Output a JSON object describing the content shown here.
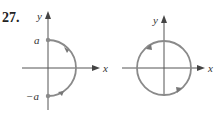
{
  "problem_number": "27.",
  "figures": [
    {
      "name": "semicircle",
      "axis_labels": {
        "x": "x",
        "y": "y"
      },
      "point_labels": {
        "top": "a",
        "bottom": "−a"
      },
      "direction": "counterclockwise (from -a up to a)"
    },
    {
      "name": "full-circle",
      "axis_labels": {
        "x": "x",
        "y": "y"
      },
      "direction": "counterclockwise"
    }
  ],
  "colors": {
    "curve": "#8a8a8a",
    "axis": "#555555",
    "text": "#222222"
  }
}
